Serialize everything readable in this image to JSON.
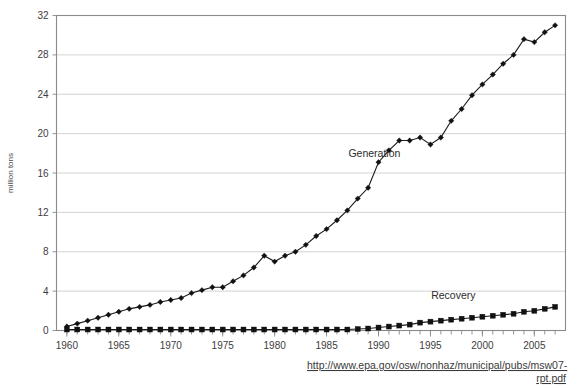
{
  "chart_data": {
    "type": "line",
    "title": "",
    "subtitle": "",
    "xlabel": "",
    "ylabel": "million tons",
    "xlim": [
      1959,
      2008
    ],
    "ylim": [
      0,
      32
    ],
    "grid": true,
    "legend_position": "inline-annotations",
    "xticks": [
      1960,
      1965,
      1970,
      1975,
      1980,
      1985,
      1990,
      1995,
      2000,
      2005
    ],
    "xtick_labels": [
      "1960",
      "1965",
      "1970",
      "1975",
      "1980",
      "1985",
      "1990",
      "1995",
      "2000",
      "2005"
    ],
    "yticks": [
      0,
      4,
      8,
      12,
      16,
      20,
      24,
      28,
      32
    ],
    "ytick_labels": [
      "0",
      "4",
      "8",
      "12",
      "16",
      "20",
      "24",
      "28",
      "32"
    ],
    "x": [
      1960,
      1961,
      1962,
      1963,
      1964,
      1965,
      1966,
      1967,
      1968,
      1969,
      1970,
      1971,
      1972,
      1973,
      1974,
      1975,
      1976,
      1977,
      1978,
      1979,
      1980,
      1981,
      1982,
      1983,
      1984,
      1985,
      1986,
      1987,
      1988,
      1989,
      1990,
      1991,
      1992,
      1993,
      1994,
      1995,
      1996,
      1997,
      1998,
      1999,
      2000,
      2001,
      2002,
      2003,
      2004,
      2005,
      2006,
      2007
    ],
    "series": [
      {
        "name": "Generation",
        "marker": "diamond",
        "label_x": 1989.6,
        "label_y": 17.6,
        "values": [
          0.4,
          0.7,
          1.0,
          1.3,
          1.6,
          1.9,
          2.2,
          2.4,
          2.6,
          2.9,
          3.1,
          3.3,
          3.8,
          4.1,
          4.4,
          4.4,
          5.0,
          5.6,
          6.4,
          7.6,
          7.0,
          7.6,
          8.0,
          8.7,
          9.6,
          10.3,
          11.2,
          12.2,
          13.4,
          14.5,
          17.1,
          18.3,
          19.3,
          19.3,
          19.6,
          18.9,
          19.6,
          21.3,
          22.5,
          23.9,
          25.0,
          26.0,
          27.1,
          28.0,
          29.6,
          29.3,
          30.3,
          31.0
        ]
      },
      {
        "name": "Recovery",
        "marker": "square",
        "label_x": 1997.2,
        "label_y": 3.2,
        "values": [
          0.1,
          0.1,
          0.1,
          0.1,
          0.1,
          0.1,
          0.1,
          0.1,
          0.1,
          0.1,
          0.1,
          0.1,
          0.1,
          0.1,
          0.1,
          0.1,
          0.1,
          0.1,
          0.1,
          0.1,
          0.1,
          0.1,
          0.1,
          0.1,
          0.1,
          0.1,
          0.1,
          0.1,
          0.15,
          0.2,
          0.3,
          0.4,
          0.5,
          0.6,
          0.8,
          0.9,
          1.0,
          1.1,
          1.2,
          1.3,
          1.4,
          1.5,
          1.6,
          1.7,
          1.9,
          2.0,
          2.2,
          2.4
        ]
      }
    ]
  },
  "source": {
    "line1": "http://www.epa.gov/osw/nonhaz/municipal/pubs/msw07-",
    "line2": "rpt.pdf"
  }
}
